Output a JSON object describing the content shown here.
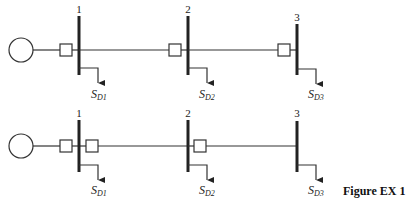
{
  "caption": "Figure EX 1",
  "colors": {
    "stroke": "#333333",
    "background": "#ffffff"
  },
  "diagrams": [
    {
      "id": "top",
      "buses": [
        {
          "label": "1",
          "load_label": "S",
          "load_sub": "D1"
        },
        {
          "label": "2",
          "load_label": "S",
          "load_sub": "D2"
        },
        {
          "label": "3",
          "load_label": "S",
          "load_sub": "D3"
        }
      ]
    },
    {
      "id": "bottom",
      "buses": [
        {
          "label": "1",
          "load_label": "S",
          "load_sub": "D1"
        },
        {
          "label": "2",
          "load_label": "S",
          "load_sub": "D2"
        },
        {
          "label": "3",
          "load_label": "S",
          "load_sub": "D3"
        }
      ]
    }
  ]
}
